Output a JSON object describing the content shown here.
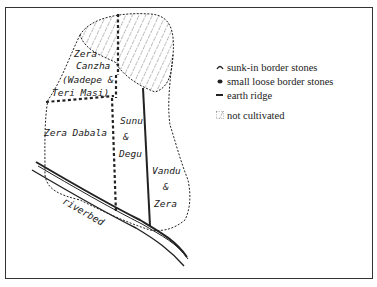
{
  "map": {
    "plots": [
      {
        "name_lines": [
          "Zera",
          "Canzha",
          "(Wadepe &",
          "Teri Masi)"
        ]
      },
      {
        "name_lines": [
          "Zera Dabala"
        ]
      },
      {
        "name_lines": [
          "Sunu",
          "&",
          "Degu"
        ]
      },
      {
        "name_lines": [
          "Vandu",
          "&",
          "Zera"
        ]
      }
    ],
    "riverbed_label": "riverbed",
    "hatched_area": "not cultivated"
  },
  "legend": {
    "items": [
      {
        "symbol": "sunk-in-stone-icon",
        "label": "sunk-in border stones"
      },
      {
        "symbol": "loose-stone-icon",
        "label": "small loose border stones"
      },
      {
        "symbol": "earth-ridge-icon",
        "label": "earth ridge"
      },
      {
        "symbol": "hatch-icon",
        "label": "not cultivated"
      }
    ]
  },
  "colors": {
    "ink": "#222222",
    "frame": "#333333",
    "background": "#ffffff"
  }
}
